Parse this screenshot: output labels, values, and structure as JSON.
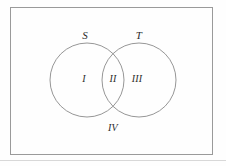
{
  "figure": {
    "kind": "venn-diagram",
    "background_color": "#fefefe",
    "stroke_color": "#8a8a8a",
    "label_color": "#2b2b2b",
    "universe_rect": {
      "x": 10,
      "y": 7,
      "width": 203,
      "height": 148,
      "border_color": "#9a9a9a",
      "border_width": 1
    },
    "circles": [
      {
        "id": "S",
        "cx": 87,
        "cy": 80,
        "r": 37,
        "stroke": "#8a8a8a"
      },
      {
        "id": "T",
        "cx": 139,
        "cy": 80,
        "r": 37,
        "stroke": "#8a8a8a"
      }
    ],
    "set_labels": [
      {
        "text": "S",
        "x": 85,
        "y": 35
      },
      {
        "text": "T",
        "x": 139,
        "y": 35
      }
    ],
    "region_labels": [
      {
        "text": "I",
        "x": 84,
        "y": 79
      },
      {
        "text": "II",
        "x": 113,
        "y": 79
      },
      {
        "text": "III",
        "x": 137,
        "y": 79
      },
      {
        "text": "IV",
        "x": 113,
        "y": 128
      }
    ],
    "bottom_rule": {
      "y": 160,
      "color": "#d8d8d8"
    }
  }
}
